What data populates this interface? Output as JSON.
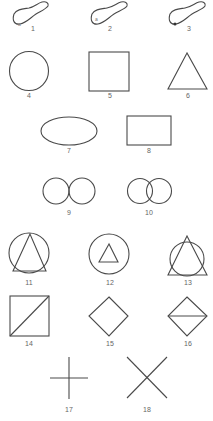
{
  "figure": {
    "stroke_color": "#4a4a4a",
    "label_color": "#666666",
    "background": "#ffffff",
    "items": [
      {
        "id": 1,
        "label": "1",
        "shape": "foot-shaped blob with small 'a' mark at lower left"
      },
      {
        "id": 2,
        "label": "2",
        "shape": "foot-shaped blob with small 'a' mark inside"
      },
      {
        "id": 3,
        "label": "3",
        "shape": "foot-shaped blob with dark dot at lower edge"
      },
      {
        "id": 4,
        "label": "4",
        "shape": "circle"
      },
      {
        "id": 5,
        "label": "5",
        "shape": "square"
      },
      {
        "id": 6,
        "label": "6",
        "shape": "triangle"
      },
      {
        "id": 7,
        "label": "7",
        "shape": "ellipse"
      },
      {
        "id": 8,
        "label": "8",
        "shape": "rectangle"
      },
      {
        "id": 9,
        "label": "9",
        "shape": "two tangent circles"
      },
      {
        "id": 10,
        "label": "10",
        "shape": "two overlapping circles"
      },
      {
        "id": 11,
        "label": "11",
        "shape": "triangle inscribed in circle"
      },
      {
        "id": 12,
        "label": "12",
        "shape": "small triangle inside circle"
      },
      {
        "id": 13,
        "label": "13",
        "shape": "triangle overlapping circle"
      },
      {
        "id": 14,
        "label": "14",
        "shape": "square with diagonal"
      },
      {
        "id": 15,
        "label": "15",
        "shape": "diamond"
      },
      {
        "id": 16,
        "label": "16",
        "shape": "diamond with horizontal line"
      },
      {
        "id": 17,
        "label": "17",
        "shape": "plus cross"
      },
      {
        "id": 18,
        "label": "18",
        "shape": "diagonal X cross"
      }
    ],
    "marks": {
      "blob1_mark": "a",
      "blob2_mark": "a"
    }
  }
}
